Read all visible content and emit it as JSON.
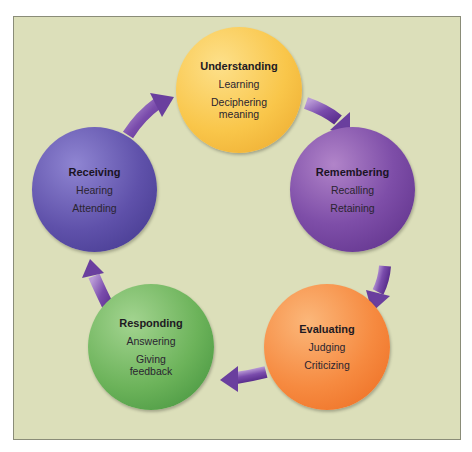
{
  "diagram": {
    "type": "cycle",
    "nodes": [
      {
        "id": "understanding",
        "title": "Understanding",
        "lines": [
          "Learning",
          "Deciphering\nmeaning"
        ],
        "color": "#f9c64a"
      },
      {
        "id": "remembering",
        "title": "Remembering",
        "lines": [
          "Recalling",
          "Retaining"
        ],
        "color": "#7e4ea8"
      },
      {
        "id": "evaluating",
        "title": "Evaluating",
        "lines": [
          "Judging",
          "Criticizing"
        ],
        "color": "#f68a40"
      },
      {
        "id": "responding",
        "title": "Responding",
        "lines": [
          "Answering",
          "Giving\nfeedback"
        ],
        "color": "#6cb35a"
      },
      {
        "id": "receiving",
        "title": "Receiving",
        "lines": [
          "Hearing",
          "Attending"
        ],
        "color": "#5f51aa"
      }
    ],
    "edges": [
      {
        "from": "receiving",
        "to": "understanding"
      },
      {
        "from": "understanding",
        "to": "remembering"
      },
      {
        "from": "remembering",
        "to": "evaluating"
      },
      {
        "from": "evaluating",
        "to": "responding"
      },
      {
        "from": "responding",
        "to": "receiving"
      }
    ],
    "arrow_color": "#6a3f9e",
    "background_color": "#dcdfba"
  }
}
